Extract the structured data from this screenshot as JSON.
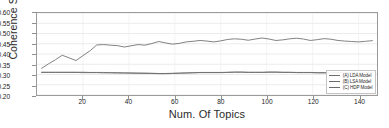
{
  "chart_data": {
    "type": "line",
    "title": "",
    "xlabel": "Num. Of Topics",
    "ylabel": "Coherence Score",
    "xlim": [
      0,
      148
    ],
    "ylim": [
      0.2,
      0.6
    ],
    "xticks": [
      20,
      40,
      60,
      80,
      100,
      120,
      140
    ],
    "yticks": [
      0.2,
      0.25,
      0.3,
      0.35,
      0.4,
      0.45,
      0.5,
      0.55,
      0.6
    ],
    "ytick_labels": [
      "0.20",
      "0.25",
      "0.30",
      "0.35",
      "0.40",
      "0.45",
      "0.50",
      "0.55",
      "0.60"
    ],
    "xtick_labels": [
      "20",
      "40",
      "60",
      "80",
      "100",
      "120",
      "140"
    ],
    "grid": true,
    "grid_color": "#e2e2e2",
    "legend_position": "lower right",
    "line_color": "#6b6b6b",
    "frame_color": "#9a9a9a",
    "x": [
      2,
      5,
      8,
      11,
      14,
      17,
      20,
      23,
      26,
      29,
      32,
      35,
      38,
      41,
      44,
      47,
      50,
      53,
      56,
      59,
      62,
      65,
      68,
      71,
      74,
      77,
      80,
      83,
      86,
      89,
      92,
      95,
      98,
      101,
      104,
      107,
      110,
      113,
      116,
      119,
      122,
      125,
      128,
      131,
      134,
      137,
      140,
      143,
      146
    ],
    "series": [
      {
        "name": "(A) LDA Model",
        "values": [
          0.33,
          0.352,
          0.372,
          0.394,
          0.381,
          0.368,
          0.392,
          0.415,
          0.444,
          0.446,
          0.443,
          0.441,
          0.434,
          0.44,
          0.446,
          0.443,
          0.451,
          0.461,
          0.454,
          0.448,
          0.452,
          0.459,
          0.462,
          0.466,
          0.463,
          0.459,
          0.464,
          0.471,
          0.474,
          0.472,
          0.467,
          0.473,
          0.478,
          0.473,
          0.466,
          0.469,
          0.474,
          0.477,
          0.473,
          0.466,
          0.47,
          0.475,
          0.472,
          0.466,
          0.463,
          0.461,
          0.459,
          0.462,
          0.465
        ]
      },
      {
        "name": "(B) LSA Model",
        "values": [
          0.311,
          0.311,
          0.311,
          0.311,
          0.311,
          0.311,
          0.311,
          0.31,
          0.31,
          0.31,
          0.309,
          0.309,
          0.308,
          0.308,
          0.307,
          0.307,
          0.306,
          0.305,
          0.305,
          0.306,
          0.307,
          0.308,
          0.309,
          0.31,
          0.31,
          0.31,
          0.31,
          0.311,
          0.312,
          0.312,
          0.311,
          0.311,
          0.311,
          0.312,
          0.312,
          0.311,
          0.311,
          0.31,
          0.31,
          0.31,
          0.309,
          0.309,
          0.309,
          0.309,
          0.309,
          0.309,
          0.31,
          0.31,
          0.31
        ]
      },
      {
        "name": "(C) HDP Model",
        "values": [
          0.31,
          0.31,
          0.31,
          0.31,
          0.31,
          0.31,
          0.309,
          0.309,
          0.309,
          0.308,
          0.308,
          0.307,
          0.307,
          0.306,
          0.306,
          0.305,
          0.305,
          0.304,
          0.304,
          0.305,
          0.306,
          0.307,
          0.308,
          0.309,
          0.309,
          0.309,
          0.309,
          0.31,
          0.311,
          0.311,
          0.31,
          0.31,
          0.31,
          0.311,
          0.311,
          0.31,
          0.31,
          0.309,
          0.309,
          0.309,
          0.308,
          0.308,
          0.308,
          0.308,
          0.308,
          0.308,
          0.309,
          0.309,
          0.309
        ]
      }
    ]
  }
}
